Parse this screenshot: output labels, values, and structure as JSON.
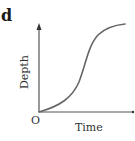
{
  "panel_label": "d",
  "axes": {
    "origin_label": "O",
    "x_label": "Time",
    "y_label": "Depth"
  },
  "colors": {
    "axis": "#555555",
    "curve": "#666666",
    "text": "#333333"
  },
  "curve": {
    "shape": "sigmoid",
    "description": "Depth increases slowly, then rapidly, then levels off over Time"
  }
}
